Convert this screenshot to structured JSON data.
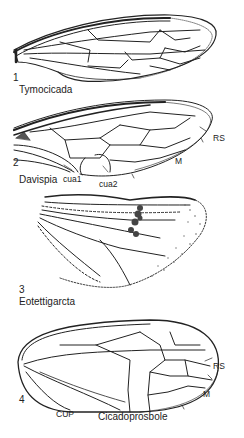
{
  "figure": {
    "panels": [
      {
        "number": "1",
        "genus": "Tymocicada",
        "vein_labels": []
      },
      {
        "number": "2",
        "genus": "Davispia",
        "vein_labels": [
          "RS",
          "M",
          "cua1",
          "cua2"
        ]
      },
      {
        "number": "3",
        "genus": "Eotettigarcta",
        "vein_labels": []
      },
      {
        "number": "4",
        "genus": "Cicadoprosbole",
        "vein_labels": [
          "RS",
          "M",
          "CUP"
        ]
      }
    ]
  },
  "colors": {
    "ink": "#222222",
    "background": "#ffffff"
  }
}
